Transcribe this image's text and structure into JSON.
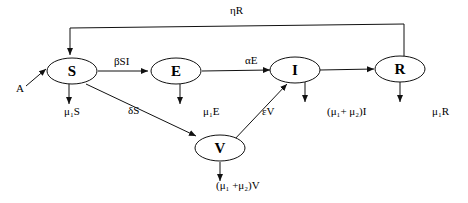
{
  "diagram": {
    "nodes": [
      {
        "id": "S",
        "label": "S"
      },
      {
        "id": "E",
        "label": "E"
      },
      {
        "id": "I",
        "label": "I"
      },
      {
        "id": "R",
        "label": "R"
      },
      {
        "id": "V",
        "label": "V"
      }
    ],
    "edge_labels": {
      "recruitment": "A",
      "s_to_e": "βSI",
      "e_to_i": "αE",
      "r_to_s": "ηR",
      "s_to_v": "δS",
      "v_to_i": "εV",
      "s_death": "μ₁S",
      "e_death": "μ₁E",
      "i_death": "(μ₁+ μ₂)I",
      "r_death": "μ₁R",
      "v_death": "(μ₁ +μ₂)V"
    }
  }
}
